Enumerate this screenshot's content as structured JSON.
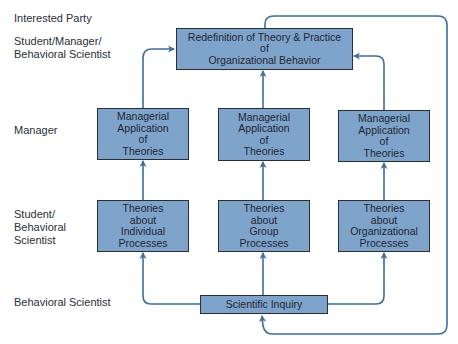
{
  "row_labels": {
    "header": "Interested Party",
    "top": "Student/Manager/\nBehavioral Scientist",
    "manager": "Manager",
    "student": "Student/\nBehavioral\nScientist",
    "scientist": "Behavioral Scientist"
  },
  "boxes": {
    "redefinition": "Redefinition of Theory & Practice\nof\nOrganizational Behavior",
    "managerial_left": "Managerial\nApplication\nof\nTheories",
    "managerial_center": "Managerial\nApplication\nof\nTheories",
    "managerial_right": "Managerial\nApplication\nof\nTheories",
    "theories_individual": "Theories\nabout\nIndividual\nProcesses",
    "theories_group": "Theories\nabout\nGroup\nProcesses",
    "theories_organizational": "Theories\nabout\nOrganizational\nProcesses",
    "scientific_inquiry": "Scientific Inquiry"
  },
  "colors": {
    "box_fill": "#7fa4cc",
    "box_border": "#2a2d35",
    "arrow": "#3d6e9c"
  }
}
